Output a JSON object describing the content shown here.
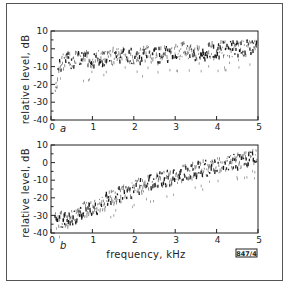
{
  "figure": {
    "id_label": "847/4",
    "xlabel": "frequency, kHz",
    "ylabel": "relative level, dB"
  },
  "chart_data": [
    {
      "type": "scatter",
      "panel": "a",
      "title": "",
      "xlabel": "",
      "ylabel": "relative level, dB",
      "xlim": [
        0,
        5
      ],
      "ylim": [
        -40,
        10
      ],
      "xticks": [
        "0",
        "1",
        "2",
        "3",
        "4",
        "5"
      ],
      "yticks": [
        "10",
        "0",
        "-10",
        "-20",
        "-30",
        "-40"
      ],
      "grid": false,
      "legend": null,
      "x": [
        0.1,
        0.2,
        0.3,
        0.4,
        0.5,
        0.6,
        0.8,
        1.0,
        1.2,
        1.4,
        1.6,
        1.8,
        2.0,
        2.2,
        2.4,
        2.6,
        2.8,
        3.0,
        3.2,
        3.4,
        3.6,
        3.8,
        4.0,
        4.2,
        4.4,
        4.6,
        4.8,
        5.0
      ],
      "y": [
        -25,
        -10,
        -7,
        -6,
        -8,
        -6,
        -6,
        -6,
        -5,
        -5,
        -4,
        -3,
        -4,
        -4,
        -3,
        -4,
        -3,
        -2,
        -1,
        -2,
        -2,
        -1,
        -1,
        0,
        0,
        0,
        1,
        1
      ]
    },
    {
      "type": "scatter",
      "panel": "b",
      "title": "",
      "xlabel": "frequency, kHz",
      "ylabel": "relative level, dB",
      "xlim": [
        0,
        5
      ],
      "ylim": [
        -40,
        10
      ],
      "xticks": [
        "0",
        "1",
        "2",
        "3",
        "4",
        "5"
      ],
      "yticks": [
        "10",
        "0",
        "-10",
        "-20",
        "-30",
        "-40"
      ],
      "grid": false,
      "legend": null,
      "x": [
        0.1,
        0.2,
        0.3,
        0.4,
        0.5,
        0.6,
        0.8,
        1.0,
        1.2,
        1.4,
        1.6,
        1.8,
        2.0,
        2.2,
        2.4,
        2.6,
        2.8,
        3.0,
        3.2,
        3.4,
        3.6,
        3.8,
        4.0,
        4.2,
        4.4,
        4.6,
        4.8,
        5.0
      ],
      "y": [
        -30,
        -33,
        -32,
        -33,
        -31,
        -30,
        -27,
        -27,
        -24,
        -21,
        -19,
        -17,
        -15,
        -13,
        -11,
        -10,
        -9,
        -8,
        -6,
        -5,
        -4,
        -3,
        -2,
        -1,
        0,
        1,
        2,
        3
      ]
    }
  ]
}
